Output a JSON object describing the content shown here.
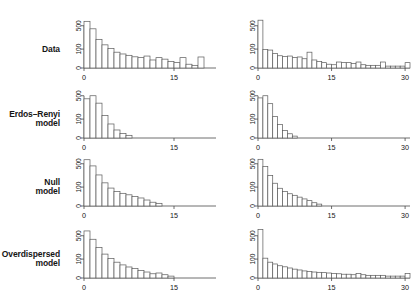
{
  "figure": {
    "type": "histogram-grid",
    "rows": 4,
    "columns": 2,
    "background": "#ffffff",
    "axis_color": "#4a4a4a",
    "bar_outline_color": "#5a5a5a",
    "bar_fill_color": "#ffffff"
  },
  "row_labels": [
    {
      "line1": "Data",
      "line2": ""
    },
    {
      "line1": "Erdos–Renyi",
      "line2": "model"
    },
    {
      "line1": "Null",
      "line2": "model"
    },
    {
      "line1": "Overdispersed",
      "line2": "model"
    }
  ],
  "axes": {
    "y_ticks": [
      "0",
      "100",
      "500"
    ],
    "y_tick_values": [
      0,
      100,
      500
    ],
    "y_scale": "sqrt",
    "x_ticks_left": [
      "0",
      "15"
    ],
    "x_tick_values_left": [
      0,
      15
    ],
    "x_ticks_right": [
      "0",
      "15",
      "30"
    ],
    "x_tick_values_right": [
      0,
      15,
      30
    ],
    "xlim_left": [
      0,
      22
    ],
    "xlim_right": [
      0,
      31
    ],
    "ylim": [
      0,
      700
    ]
  },
  "chart_data": [
    {
      "type": "bar",
      "id": "data-left",
      "row": "Data",
      "column": "left",
      "title": "",
      "xlabel": "",
      "ylabel": "",
      "xlim": [
        0,
        22
      ],
      "ylim": [
        0,
        700
      ],
      "yscale": "sqrt",
      "ytick_labels": [
        "0",
        "100",
        "500"
      ],
      "xtick_labels": [
        "0",
        "15"
      ],
      "grid": false,
      "x": [
        0,
        1,
        2,
        3,
        4,
        5,
        6,
        7,
        8,
        9,
        10,
        11,
        12,
        13,
        14,
        15,
        16,
        17,
        18,
        19,
        20,
        21
      ],
      "values": [
        610,
        430,
        230,
        150,
        105,
        70,
        55,
        45,
        35,
        30,
        40,
        18,
        30,
        22,
        12,
        8,
        30,
        4,
        2,
        34,
        0,
        0
      ]
    },
    {
      "type": "bar",
      "id": "data-right",
      "row": "Data",
      "column": "right",
      "title": "",
      "xlabel": "",
      "ylabel": "",
      "xlim": [
        0,
        31
      ],
      "ylim": [
        0,
        700
      ],
      "yscale": "sqrt",
      "ytick_labels": [
        "0",
        "100",
        "500"
      ],
      "xtick_labels": [
        "0",
        "15",
        "30"
      ],
      "grid": false,
      "x": [
        0,
        1,
        2,
        3,
        4,
        5,
        6,
        7,
        8,
        9,
        10,
        11,
        12,
        13,
        14,
        15,
        16,
        17,
        18,
        19,
        20,
        21,
        22,
        23,
        24,
        25,
        26,
        27,
        28,
        29,
        30
      ],
      "values": [
        640,
        95,
        90,
        60,
        42,
        36,
        40,
        30,
        34,
        24,
        70,
        18,
        12,
        8,
        4,
        3,
        10,
        8,
        8,
        6,
        10,
        3,
        2,
        2,
        2,
        10,
        1,
        1,
        1,
        1,
        8
      ]
    },
    {
      "type": "bar",
      "id": "erdos-renyi-left",
      "row": "Erdos–Renyi model",
      "column": "left",
      "title": "",
      "xlabel": "",
      "ylabel": "",
      "xlim": [
        0,
        22
      ],
      "ylim": [
        0,
        700
      ],
      "yscale": "sqrt",
      "ytick_labels": [
        "0",
        "100",
        "500"
      ],
      "xtick_labels": [
        "0",
        "15"
      ],
      "grid": false,
      "x": [
        0,
        1,
        2,
        3,
        4,
        5,
        6,
        7,
        8,
        9,
        10,
        11,
        12,
        13,
        14,
        15,
        16,
        17,
        18,
        19,
        20,
        21
      ],
      "values": [
        430,
        500,
        340,
        140,
        55,
        18,
        6,
        2,
        0,
        0,
        0,
        0,
        0,
        0,
        0,
        0,
        0,
        0,
        0,
        0,
        0,
        0
      ]
    },
    {
      "type": "bar",
      "id": "erdos-renyi-right",
      "row": "Erdos–Renyi model",
      "column": "right",
      "title": "",
      "xlabel": "",
      "ylabel": "",
      "xlim": [
        0,
        31
      ],
      "ylim": [
        0,
        700
      ],
      "yscale": "sqrt",
      "ytick_labels": [
        "0",
        "100",
        "500"
      ],
      "xtick_labels": [
        "0",
        "15",
        "30"
      ],
      "grid": false,
      "x": [
        0,
        1,
        2,
        3,
        4,
        5,
        6,
        7,
        8,
        9,
        10,
        11,
        12,
        13,
        14,
        15,
        16,
        17,
        18,
        19,
        20,
        21,
        22,
        23,
        24,
        25,
        26,
        27,
        28,
        29,
        30
      ],
      "values": [
        450,
        500,
        330,
        130,
        50,
        16,
        5,
        1,
        0,
        0,
        0,
        0,
        0,
        0,
        0,
        0,
        0,
        0,
        0,
        0,
        0,
        0,
        0,
        0,
        0,
        0,
        0,
        0,
        0,
        0,
        0
      ]
    },
    {
      "type": "bar",
      "id": "null-model-left",
      "row": "Null model",
      "column": "left",
      "title": "",
      "xlabel": "",
      "ylabel": "",
      "xlim": [
        0,
        22
      ],
      "ylim": [
        0,
        700
      ],
      "yscale": "sqrt",
      "ytick_labels": [
        "0",
        "100",
        "500"
      ],
      "xtick_labels": [
        "0",
        "15"
      ],
      "grid": false,
      "x": [
        0,
        1,
        2,
        3,
        4,
        5,
        6,
        7,
        8,
        9,
        10,
        11,
        12,
        13,
        14,
        15,
        16,
        17,
        18,
        19,
        20,
        21
      ],
      "values": [
        600,
        450,
        270,
        150,
        90,
        60,
        45,
        35,
        25,
        18,
        10,
        4,
        2,
        0,
        0,
        0,
        0,
        0,
        0,
        0,
        0,
        0
      ]
    },
    {
      "type": "bar",
      "id": "null-model-right",
      "row": "Null model",
      "column": "right",
      "title": "",
      "xlabel": "",
      "ylabel": "",
      "xlim": [
        0,
        31
      ],
      "ylim": [
        0,
        700
      ],
      "yscale": "sqrt",
      "ytick_labels": [
        "0",
        "100",
        "500"
      ],
      "xtick_labels": [
        "0",
        "15",
        "30"
      ],
      "grid": false,
      "x": [
        0,
        1,
        2,
        3,
        4,
        5,
        6,
        7,
        8,
        9,
        10,
        11,
        12,
        13,
        14,
        15,
        16,
        17,
        18,
        19,
        20,
        21,
        22,
        23,
        24,
        25,
        26,
        27,
        28,
        29,
        30
      ],
      "values": [
        610,
        440,
        260,
        145,
        88,
        58,
        42,
        32,
        22,
        14,
        8,
        3,
        1,
        0,
        0,
        0,
        0,
        0,
        0,
        0,
        0,
        0,
        0,
        0,
        0,
        0,
        0,
        0,
        0,
        0,
        0
      ]
    },
    {
      "type": "bar",
      "id": "overdispersed-left",
      "row": "Overdispersed model",
      "column": "left",
      "title": "",
      "xlabel": "",
      "ylabel": "",
      "xlim": [
        0,
        22
      ],
      "ylim": [
        0,
        700
      ],
      "yscale": "sqrt",
      "ytick_labels": [
        "0",
        "100",
        "500"
      ],
      "xtick_labels": [
        "0",
        "15"
      ],
      "grid": false,
      "x": [
        0,
        1,
        2,
        3,
        4,
        5,
        6,
        7,
        8,
        9,
        10,
        11,
        12,
        13,
        14,
        15,
        16,
        17,
        18,
        19,
        20,
        21
      ],
      "values": [
        620,
        420,
        260,
        160,
        105,
        70,
        48,
        34,
        25,
        16,
        10,
        5,
        7,
        3,
        1,
        0,
        0,
        0,
        0,
        0,
        0,
        0
      ]
    },
    {
      "type": "bar",
      "id": "overdispersed-right",
      "row": "Overdispersed model",
      "column": "right",
      "title": "",
      "xlabel": "",
      "ylabel": "",
      "xlim": [
        0,
        31
      ],
      "ylim": [
        0,
        700
      ],
      "yscale": "sqrt",
      "ytick_labels": [
        "0",
        "100",
        "500"
      ],
      "xtick_labels": [
        "0",
        "15",
        "30"
      ],
      "grid": false,
      "x": [
        0,
        1,
        2,
        3,
        4,
        5,
        6,
        7,
        8,
        9,
        10,
        11,
        12,
        13,
        14,
        15,
        16,
        17,
        18,
        19,
        20,
        21,
        22,
        23,
        24,
        25,
        26,
        27,
        28,
        29,
        30
      ],
      "values": [
        660,
        110,
        70,
        55,
        42,
        35,
        28,
        22,
        18,
        14,
        12,
        10,
        9,
        8,
        7,
        6,
        5,
        4,
        4,
        3,
        6,
        3,
        2,
        2,
        2,
        2,
        1,
        1,
        1,
        1,
        6
      ]
    }
  ]
}
